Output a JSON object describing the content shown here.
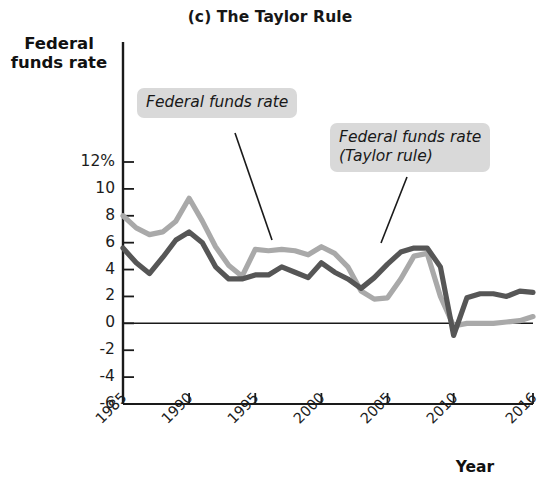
{
  "chart": {
    "title": "(c) The Taylor Rule",
    "ylabel": "Federal\nfunds rate",
    "xlabel": "Year"
  },
  "annotations": {
    "ffr": "Federal funds rate",
    "taylor": "Federal funds rate\n(Taylor rule)"
  },
  "axis": {
    "y_ticks": [
      "12%",
      "10",
      "8",
      "6",
      "4",
      "2",
      "0",
      "-2",
      "-4",
      "-6"
    ],
    "x_ticks": [
      "1985",
      "1990",
      "1995",
      "2000",
      "2005",
      "2010",
      "2016"
    ]
  },
  "chart_data": {
    "type": "line",
    "title": "(c) The Taylor Rule",
    "xlabel": "Year",
    "ylabel": "Federal funds rate",
    "xlim": [
      1985,
      2016
    ],
    "ylim": [
      -6,
      12
    ],
    "ytick_values": [
      12,
      10,
      8,
      6,
      4,
      2,
      0,
      -2,
      -4,
      -6
    ],
    "xtick_values": [
      1985,
      1990,
      1995,
      2000,
      2005,
      2010,
      2016
    ],
    "grid": false,
    "legend": "annotations-on-plot",
    "x": [
      1985,
      1986,
      1987,
      1988,
      1989,
      1990,
      1991,
      1992,
      1993,
      1994,
      1995,
      1996,
      1997,
      1998,
      1999,
      2000,
      2001,
      2002,
      2003,
      2004,
      2005,
      2006,
      2007,
      2008,
      2009,
      2010,
      2011,
      2012,
      2013,
      2014,
      2015,
      2016
    ],
    "series": [
      {
        "name": "Federal funds rate (Taylor rule)",
        "color": "#a9a9a9",
        "values": [
          8.0,
          7.1,
          6.6,
          6.8,
          7.6,
          9.3,
          7.6,
          5.7,
          4.3,
          3.5,
          5.5,
          5.4,
          5.5,
          5.4,
          5.1,
          5.7,
          5.2,
          4.2,
          2.4,
          1.8,
          1.9,
          3.3,
          5.0,
          5.2,
          2.0,
          -0.2,
          0.0,
          0.0,
          0.0,
          0.1,
          0.2,
          0.5
        ]
      },
      {
        "name": "Federal funds rate",
        "color": "#565656",
        "values": [
          5.6,
          4.5,
          3.7,
          4.9,
          6.2,
          6.8,
          6.0,
          4.2,
          3.3,
          3.3,
          3.6,
          3.6,
          4.2,
          3.8,
          3.4,
          4.5,
          3.8,
          3.3,
          2.6,
          3.4,
          4.4,
          5.3,
          5.6,
          5.6,
          4.2,
          -0.9,
          1.9,
          2.2,
          2.2,
          2.0,
          2.4,
          2.3
        ]
      }
    ]
  }
}
